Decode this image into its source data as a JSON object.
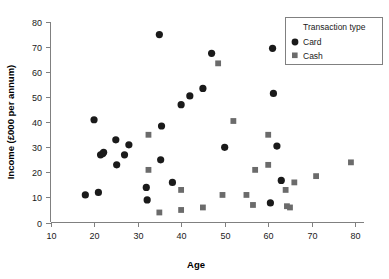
{
  "chart_data": {
    "type": "scatter",
    "title": "",
    "xlabel": "Age",
    "ylabel": "Income (£000 per annum)",
    "xlim": [
      10,
      82
    ],
    "ylim": [
      0,
      80
    ],
    "xticks": [
      10,
      20,
      30,
      40,
      50,
      60,
      70,
      80
    ],
    "yticks": [
      0,
      10,
      20,
      30,
      40,
      50,
      60,
      70,
      80
    ],
    "grid": false,
    "legend": {
      "title": "Transaction type",
      "position": "top-right",
      "entries": [
        {
          "name": "Card",
          "marker": "circle",
          "color": "#1a1a1a"
        },
        {
          "name": "Cash",
          "marker": "square",
          "color": "#6b6b6b"
        }
      ]
    },
    "series": [
      {
        "name": "Card",
        "marker": "circle",
        "color": "#1a1a1a",
        "points": [
          [
            18,
            11
          ],
          [
            20,
            41
          ],
          [
            21,
            12
          ],
          [
            21.5,
            27
          ],
          [
            22,
            27.5
          ],
          [
            22.2,
            28
          ],
          [
            25,
            33
          ],
          [
            25.2,
            23
          ],
          [
            27,
            27
          ],
          [
            28,
            31
          ],
          [
            32,
            14
          ],
          [
            32.2,
            9
          ],
          [
            35,
            75
          ],
          [
            35.3,
            25
          ],
          [
            35.5,
            38.5
          ],
          [
            38,
            16
          ],
          [
            40,
            47
          ],
          [
            42,
            50.5
          ],
          [
            45,
            53.5
          ],
          [
            47,
            67.5
          ],
          [
            50,
            30
          ],
          [
            61,
            69.5
          ],
          [
            61.2,
            51.5
          ],
          [
            60.5,
            7.8
          ],
          [
            62,
            30.5
          ],
          [
            63,
            16.8
          ]
        ]
      },
      {
        "name": "Cash",
        "marker": "square",
        "color": "#6b6b6b",
        "points": [
          [
            32.5,
            35
          ],
          [
            32.5,
            21
          ],
          [
            35,
            4
          ],
          [
            40,
            13
          ],
          [
            40,
            5
          ],
          [
            45,
            6
          ],
          [
            48.5,
            63.5
          ],
          [
            49.5,
            11
          ],
          [
            52,
            40.5
          ],
          [
            55,
            11
          ],
          [
            56.5,
            7
          ],
          [
            57,
            21
          ],
          [
            60,
            35
          ],
          [
            60,
            23
          ],
          [
            64,
            13
          ],
          [
            64.3,
            6.5
          ],
          [
            65,
            6
          ],
          [
            66,
            16
          ],
          [
            71,
            18.5
          ],
          [
            79,
            24
          ]
        ]
      }
    ]
  },
  "axis": {
    "x_title": "Age",
    "y_title": "Income (£000 per annum)",
    "x_tick_labels": [
      "10",
      "20",
      "30",
      "40",
      "50",
      "60",
      "70",
      "80"
    ],
    "y_tick_labels": [
      "0",
      "10",
      "20",
      "30",
      "40",
      "50",
      "60",
      "70",
      "80"
    ]
  },
  "legend": {
    "title": "Transaction type",
    "card_label": "Card",
    "cash_label": "Cash"
  },
  "colors": {
    "card": "#1a1a1a",
    "cash": "#6b6b6b",
    "axis": "#808080",
    "text": "#1a1a1a",
    "background": "#ffffff"
  }
}
